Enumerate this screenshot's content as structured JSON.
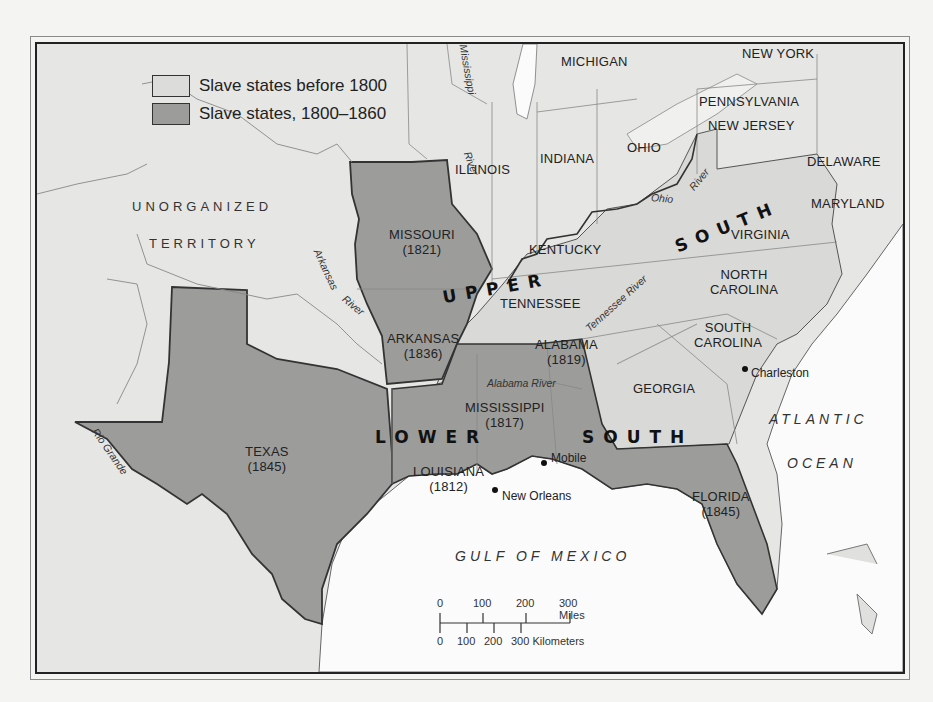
{
  "legend": {
    "items": [
      {
        "label": "Slave states before 1800",
        "color": "#dcdcda"
      },
      {
        "label": "Slave states, 1800–1860",
        "color": "#9c9c9a"
      }
    ]
  },
  "colors": {
    "territory_other": "#e6e6e4",
    "slave_before_1800": "#d9d9d7",
    "slave_1800_1860": "#9c9c9a",
    "water": "#fbfbfb",
    "border": "#333333"
  },
  "states": {
    "missouri": {
      "name": "MISSOURI",
      "year": "(1821)"
    },
    "arkansas": {
      "name": "ARKANSAS",
      "year": "(1836)"
    },
    "alabama": {
      "name": "ALABAMA",
      "year": "(1819)"
    },
    "mississippi": {
      "name": "MISSISSIPPI",
      "year": "(1817)"
    },
    "texas": {
      "name": "TEXAS",
      "year": "(1845)"
    },
    "louisiana": {
      "name": "LOUISIANA",
      "year": "(1812)"
    },
    "florida": {
      "name": "FLORIDA",
      "year": "(1845)"
    },
    "illinois": {
      "name": "ILLINOIS"
    },
    "indiana": {
      "name": "INDIANA"
    },
    "ohio": {
      "name": "OHIO"
    },
    "michigan": {
      "name": "MICHIGAN"
    },
    "new_york": {
      "name": "NEW YORK"
    },
    "pennsylvania": {
      "name": "PENNSYLVANIA"
    },
    "new_jersey": {
      "name": "NEW JERSEY"
    },
    "delaware": {
      "name": "DELAWARE"
    },
    "maryland": {
      "name": "MARYLAND"
    },
    "kentucky": {
      "name": "KENTUCKY"
    },
    "virginia": {
      "name": "VIRGINIA"
    },
    "tennessee": {
      "name": "TENNESSEE"
    },
    "north_carolina": {
      "name": "NORTH",
      "name2": "CAROLINA"
    },
    "south_carolina": {
      "name": "SOUTH",
      "name2": "CAROLINA"
    },
    "georgia": {
      "name": "GEORGIA"
    }
  },
  "territories": {
    "unorganized_1": "UNORGANIZED",
    "unorganized_2": "TERRITORY"
  },
  "regions": {
    "upper": "UPPER",
    "upper_south": "SOUTH",
    "lower": "LOWER",
    "lower_south": "SOUTH"
  },
  "rivers": {
    "mississippi": "Mississippi",
    "mississippi_river": "River",
    "arkansas": "Arkansas",
    "arkansas_river": "River",
    "ohio": "Ohio",
    "ohio_river": "River",
    "tennessee": "Tennessee River",
    "alabama": "Alabama River",
    "rio_grande": "Rio Grande"
  },
  "water_bodies": {
    "atlantic_1": "ATLANTIC",
    "atlantic_2": "OCEAN",
    "gulf": "GULF OF MEXICO"
  },
  "cities": {
    "charleston": "Charleston",
    "mobile": "Mobile",
    "new_orleans": "New Orleans"
  },
  "scale": {
    "miles_ticks": [
      "0",
      "100",
      "200",
      "300 Miles"
    ],
    "km_ticks": [
      "0",
      "100",
      "200",
      "300 Kilometers"
    ]
  }
}
